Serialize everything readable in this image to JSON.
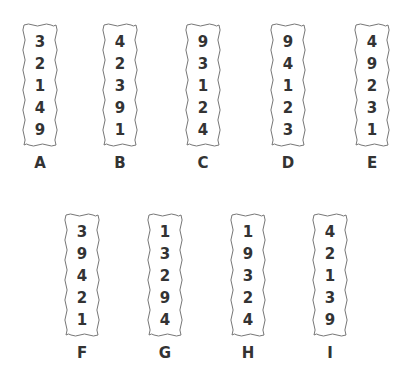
{
  "strips": [
    {
      "label": "A",
      "digits": [
        "3",
        "2",
        "1",
        "4",
        "9"
      ]
    },
    {
      "label": "B",
      "digits": [
        "4",
        "2",
        "3",
        "9",
        "1"
      ]
    },
    {
      "label": "C",
      "digits": [
        "9",
        "3",
        "1",
        "2",
        "4"
      ]
    },
    {
      "label": "D",
      "digits": [
        "9",
        "4",
        "1",
        "2",
        "3"
      ]
    },
    {
      "label": "E",
      "digits": [
        "4",
        "9",
        "2",
        "3",
        "1"
      ]
    },
    {
      "label": "F",
      "digits": [
        "3",
        "9",
        "4",
        "2",
        "1"
      ]
    },
    {
      "label": "G",
      "digits": [
        "1",
        "3",
        "2",
        "9",
        "4"
      ]
    },
    {
      "label": "H",
      "digits": [
        "1",
        "9",
        "3",
        "2",
        "4"
      ]
    },
    {
      "label": "I",
      "digits": [
        "4",
        "2",
        "1",
        "3",
        "9"
      ]
    }
  ]
}
